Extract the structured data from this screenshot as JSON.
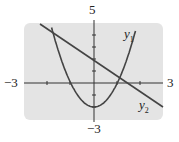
{
  "chart_data": {
    "type": "line",
    "title": "",
    "xlabel": "",
    "ylabel": "",
    "xlim": [
      -3,
      3
    ],
    "ylim": [
      -3,
      5
    ],
    "tick_labels": {
      "xmin": "−3",
      "xmax": "3",
      "ymax": "5",
      "ymin": "−3"
    },
    "grid": false,
    "series": [
      {
        "name": "y1",
        "type": "parabola",
        "equation": "y = 2x^2 - 2",
        "vertex": [
          0,
          -2
        ],
        "roots": [
          -1,
          1
        ]
      },
      {
        "name": "y2",
        "type": "line",
        "equation": "y = -1.4x + 2",
        "y_intercept": 2,
        "x_intercept": 1.4
      }
    ]
  },
  "labels": {
    "y1": "y",
    "y1sub": "1",
    "y2": "y",
    "y2sub": "2"
  }
}
